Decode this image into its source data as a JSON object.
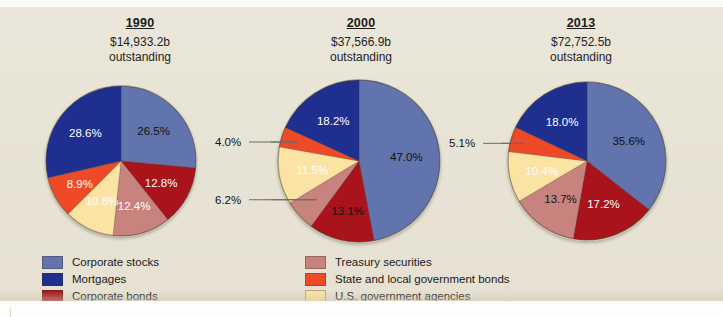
{
  "chart_data": {
    "type": "pie",
    "title": "",
    "legend_position": "bottom",
    "categories": [
      "Corporate stocks",
      "Mortgages",
      "Corporate bonds",
      "Treasury securities",
      "State and local government bonds",
      "U.S. government agencies"
    ],
    "colors": [
      "#6274ad",
      "#1f2f8f",
      "#a9131c",
      "#c9837f",
      "#ef4a28",
      "#fbe3a3"
    ],
    "charts": [
      {
        "year": "1990",
        "amount": "$14,933.2b",
        "sub": "outstanding",
        "values": [
          26.5,
          28.6,
          12.8,
          12.4,
          8.9,
          10.8
        ],
        "labels": [
          "26.5%",
          "28.6%",
          "12.8%",
          "12.4%",
          "8.9%",
          "10.8%"
        ]
      },
      {
        "year": "2000",
        "amount": "$37,566.9b",
        "sub": "outstanding",
        "values": [
          47.0,
          18.2,
          13.1,
          6.2,
          4.0,
          11.5
        ],
        "labels": [
          "47.0%",
          "18.2%",
          "13.1%",
          "6.2%",
          "4.0%",
          "11.5%"
        ]
      },
      {
        "year": "2013",
        "amount": "$72,752.5b",
        "sub": "outstanding",
        "values": [
          35.6,
          18.0,
          17.2,
          13.7,
          5.1,
          10.4
        ],
        "labels": [
          "35.6%",
          "18.0%",
          "17.2%",
          "13.7%",
          "5.1%",
          "10.4%"
        ]
      }
    ]
  },
  "legend": {
    "left_items": [
      {
        "label": "Corporate stocks",
        "color": "#6274ad"
      },
      {
        "label": "Mortgages",
        "color": "#1f2f8f"
      },
      {
        "label": "Corporate bonds",
        "color": "#a9131c"
      }
    ],
    "right_items": [
      {
        "label": "Treasury securities",
        "color": "#c9837f"
      },
      {
        "label": "State and local government bonds",
        "color": "#ef4a28"
      },
      {
        "label": "U.S. government agencies",
        "color": "#fbe3a3"
      }
    ]
  }
}
